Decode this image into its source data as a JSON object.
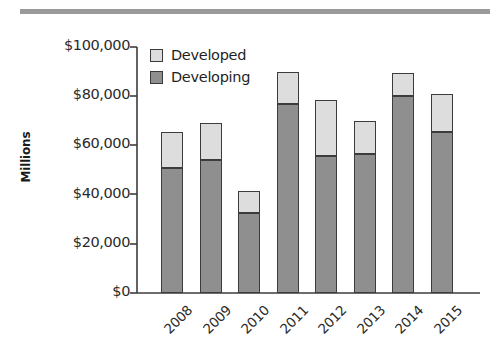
{
  "chart_data": {
    "type": "bar",
    "subtype": "stacked-bar",
    "title": "",
    "xlabel": "",
    "ylabel": "Millions",
    "categories": [
      "2008",
      "2009",
      "2010",
      "2011",
      "2012",
      "2013",
      "2014",
      "2015"
    ],
    "series": [
      {
        "name": "Developing",
        "color": "#8f8f8f",
        "values": [
          51000,
          54000,
          32500,
          77000,
          55500,
          56500,
          80000,
          65500
        ]
      },
      {
        "name": "Developed",
        "color": "#dddddd",
        "values": [
          14500,
          15000,
          9000,
          13000,
          23000,
          13500,
          9500,
          15500
        ]
      }
    ],
    "totals": [
      65500,
      69000,
      41500,
      90000,
      78500,
      70000,
      89500,
      81000
    ],
    "ylim": [
      0,
      100000
    ],
    "ytick_values": [
      0,
      20000,
      40000,
      60000,
      80000,
      100000
    ],
    "ytick_labels": [
      "$0",
      "$20,000",
      "$40,000",
      "$60,000",
      "$80,000",
      "$100,000"
    ],
    "grid": false,
    "legend_position": "top-left",
    "legend": [
      "Developed",
      "Developing"
    ],
    "xtick_rotation": -45
  },
  "legend": {
    "entries": [
      {
        "label": "Developed",
        "color": "#dddddd"
      },
      {
        "label": "Developing",
        "color": "#8f8f8f"
      }
    ]
  },
  "axes": {
    "y_title": "Millions",
    "y_labels": [
      "$100,000",
      "$80,000",
      "$60,000",
      "$40,000",
      "$20,000",
      "$0"
    ],
    "x_labels": [
      "2008",
      "2009",
      "2010",
      "2011",
      "2012",
      "2013",
      "2014",
      "2015"
    ]
  },
  "decoration": {
    "top_rule_color": "#9a9a9a"
  }
}
